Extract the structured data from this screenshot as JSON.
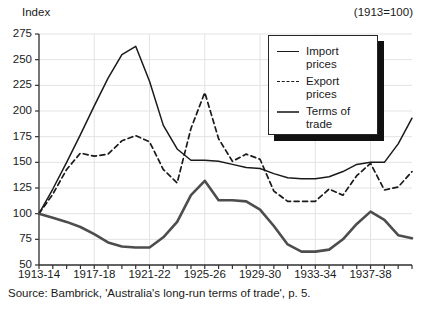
{
  "figure": {
    "y_axis_title": "Index",
    "base_note": "(1913=100)",
    "source_note": "Source: Bambrick, 'Australia's long-run terms of trade', p. 5."
  },
  "legend": {
    "items": [
      {
        "label": "Import\nprices",
        "style": "solid-thin",
        "color": "#1a1a1a"
      },
      {
        "label": "Export\nprices",
        "style": "dashed",
        "color": "#1a1a1a"
      },
      {
        "label": "Terms of\ntrade",
        "style": "solid-thick",
        "color": "#4d4d4d"
      }
    ]
  },
  "chart_data": {
    "type": "line",
    "title": "",
    "subtitle": "",
    "xlabel": "",
    "ylabel": "Index",
    "annotation": "(1913=100)",
    "source": "Source: Bambrick, 'Australia's long-run terms of trade', p. 5.",
    "ylim": [
      50,
      275
    ],
    "ytick_labels": [
      "275",
      "250",
      "225",
      "200",
      "175",
      "150",
      "125",
      "100",
      "75",
      "50"
    ],
    "yticks": [
      275,
      250,
      225,
      200,
      175,
      150,
      125,
      100,
      75,
      50
    ],
    "grid": true,
    "legend_position": "upper-right",
    "x": [
      "1913-14",
      "1914-15",
      "1915-16",
      "1916-17",
      "1917-18",
      "1918-19",
      "1919-20",
      "1920-21",
      "1921-22",
      "1922-23",
      "1923-24",
      "1924-25",
      "1925-26",
      "1926-27",
      "1927-28",
      "1928-29",
      "1929-30",
      "1930-31",
      "1931-32",
      "1932-33",
      "1933-34",
      "1934-35",
      "1935-36",
      "1936-37",
      "1937-38",
      "1938-39",
      "1939-40",
      "1940-41"
    ],
    "xtick_labels": [
      "1913-14",
      "1917-18",
      "1921-22",
      "1925-26",
      "1929-30",
      "1933-34",
      "1937-38"
    ],
    "xtick_indices": [
      0,
      4,
      8,
      12,
      16,
      20,
      24
    ],
    "series": [
      {
        "name": "Import prices",
        "style": "solid-thin",
        "color": "#1a1a1a",
        "values": [
          100,
          124,
          150,
          177,
          205,
          232,
          255,
          263,
          229,
          186,
          163,
          152,
          152,
          151,
          148,
          145,
          144,
          139,
          135,
          134,
          134,
          136,
          141,
          148,
          150,
          150,
          168,
          193
        ]
      },
      {
        "name": "Export prices",
        "style": "dashed",
        "color": "#1a1a1a",
        "values": [
          100,
          119,
          143,
          159,
          156,
          158,
          171,
          176,
          170,
          143,
          130,
          183,
          218,
          173,
          151,
          158,
          153,
          122,
          112,
          112,
          112,
          124,
          118,
          137,
          149,
          123,
          126,
          141
        ]
      },
      {
        "name": "Terms of trade",
        "style": "solid-thick",
        "color": "#4d4d4d",
        "values": [
          100,
          96,
          92,
          87,
          80,
          72,
          68,
          67,
          67,
          77,
          92,
          118,
          132,
          113,
          113,
          112,
          104,
          88,
          70,
          63,
          63,
          65,
          75,
          90,
          102,
          94,
          79,
          76
        ]
      }
    ]
  }
}
